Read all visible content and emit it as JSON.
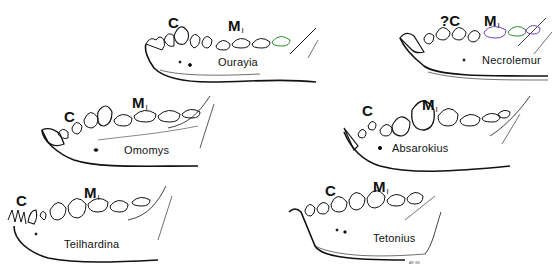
{
  "figure": {
    "type": "line-drawing illustration of fossil primate lower jaws (lateral view)",
    "tooth_labels": {
      "canine": "C",
      "uncertain_canine": "?C",
      "molar_prefix": "M",
      "molar_sub": "I"
    },
    "artist_initials": "AV 85",
    "accent_colors": {
      "ink": "#111111",
      "green_tint": "#4aa84a",
      "purple_tint": "#8a4fc9"
    },
    "specimens": [
      {
        "name": "Ourayia",
        "canine_label": "C",
        "molar_label": "M",
        "molar_sub": "I"
      },
      {
        "name": "Necrolemur",
        "canine_label": "?C",
        "molar_label": "M",
        "molar_sub": "I"
      },
      {
        "name": "Omomys",
        "canine_label": "C",
        "molar_label": "M",
        "molar_sub": "I"
      },
      {
        "name": "Absarokius",
        "canine_label": "C",
        "molar_label": "M",
        "molar_sub": "I"
      },
      {
        "name": "Teilhardina",
        "canine_label": "C",
        "molar_label": "M",
        "molar_sub": "I"
      },
      {
        "name": "Tetonius",
        "canine_label": "C",
        "molar_label": "M",
        "molar_sub": "I"
      }
    ]
  }
}
